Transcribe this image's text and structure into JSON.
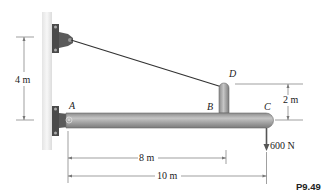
{
  "figure": {
    "id_label": "P9.49",
    "points": {
      "A": "A",
      "B": "B",
      "C": "C",
      "D": "D"
    },
    "dimensions": {
      "wall_height": "4 m",
      "post_height": "2 m",
      "ab_length": "8 m",
      "ac_length": "10 m"
    },
    "load": {
      "label": "600 N"
    },
    "colors": {
      "wall": "#efefef",
      "beam": "#a9a9a9",
      "bracket": "#555555",
      "cable": "#333333",
      "dim_line": "#777777"
    }
  }
}
